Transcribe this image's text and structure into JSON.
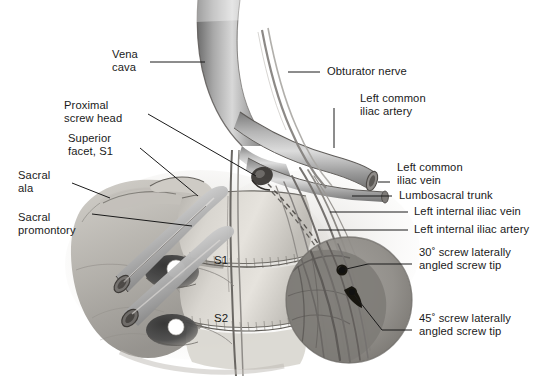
{
  "figure": {
    "background_color": "#ffffff",
    "ink_color": "#1a1a1a",
    "width": 545,
    "height": 391
  },
  "labels": {
    "vena_cava": "Vena\ncava",
    "proximal_screw_head": "Proximal\nscrew head",
    "superior_facet_s1": "Superior\nfacet, S1",
    "sacral_ala": "Sacral\nala",
    "sacral_promontory": "Sacral\npromontory",
    "obturator_nerve": "Obturator nerve",
    "left_common_iliac_artery": "Left common\niliac artery",
    "left_common_iliac_vein": "Left common\niliac vein",
    "lumbosacral_trunk": "Lumbosacral trunk",
    "left_internal_iliac_vein": "Left internal iliac vein",
    "left_internal_iliac_artery": "Left internal iliac artery",
    "screw_30": "30˚ screw laterally\nangled screw tip",
    "screw_45": "45˚ screw laterally\nangled screw tip",
    "vertebra_s1": "S1",
    "vertebra_s2": "S2"
  },
  "anatomy": {
    "structures": [
      "vena cava",
      "left common iliac artery",
      "left common iliac vein",
      "left internal iliac artery",
      "left internal iliac vein",
      "obturator nerve",
      "lumbosacral trunk",
      "sacral ala",
      "sacral promontory",
      "superior facet S1",
      "S1 vertebral body",
      "S2 vertebral body",
      "S1 anterior sacral foramen",
      "S2 anterior sacral foramen",
      "proximal screw head",
      "30 degree laterally angled screw",
      "45 degree laterally angled screw"
    ],
    "magnifier_note": "circular magnified inset showing two screw tips"
  }
}
